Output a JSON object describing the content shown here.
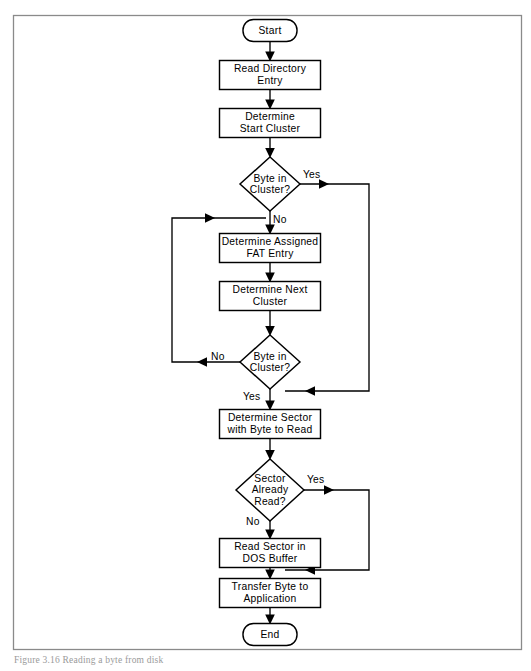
{
  "figure": {
    "caption": "Figure 3.16  Reading a byte from disk",
    "frame": {
      "x": 13,
      "y": 15,
      "width": 509,
      "height": 635,
      "border_color": "#8a8a8a"
    }
  },
  "colors": {
    "shape_stroke": "#000000",
    "shape_fill": "#ffffff",
    "connector": "#000000",
    "frame": "#8a8a8a",
    "caption_text": "#9a9a9a"
  },
  "nodes": [
    {
      "id": "start",
      "type": "terminator",
      "label": "Start",
      "lines": [
        "Start"
      ],
      "x": 243,
      "y": 19,
      "width": 54,
      "height": 23
    },
    {
      "id": "read-directory-entry",
      "type": "process",
      "label": "Read Directory Entry",
      "lines": [
        "Read  Directory",
        "Entry"
      ],
      "x": 219,
      "y": 60,
      "width": 101,
      "height": 30
    },
    {
      "id": "determine-start-cluster",
      "type": "process",
      "label": "Determine Start Cluster",
      "lines": [
        "Determine",
        "Start  Cluster"
      ],
      "x": 219,
      "y": 108,
      "width": 101,
      "height": 30
    },
    {
      "id": "byte-in-cluster-1",
      "type": "decision",
      "label": "Byte in Cluster?",
      "lines": [
        "Byte  in",
        "Cluster?"
      ],
      "x": 240,
      "y": 157,
      "width": 60,
      "height": 54
    },
    {
      "id": "determine-assigned-fat-entry",
      "type": "process",
      "label": "Determine Assigned FAT Entry",
      "lines": [
        "Determine  Assigned",
        "FAT  Entry"
      ],
      "x": 219,
      "y": 233,
      "width": 101,
      "height": 30
    },
    {
      "id": "determine-next-cluster",
      "type": "process",
      "label": "Determine Next Cluster",
      "lines": [
        "Determine  Next",
        "Cluster"
      ],
      "x": 219,
      "y": 281,
      "width": 101,
      "height": 30
    },
    {
      "id": "byte-in-cluster-2",
      "type": "decision",
      "label": "Byte in Cluster?",
      "lines": [
        "Byte  in",
        "Cluster?"
      ],
      "x": 240,
      "y": 335,
      "width": 60,
      "height": 54
    },
    {
      "id": "determine-sector-with-byte",
      "type": "process",
      "label": "Determine Sector with Byte to Read",
      "lines": [
        "Determine  Sector",
        "with  Byte  to  Read"
      ],
      "x": 219,
      "y": 409,
      "width": 101,
      "height": 30
    },
    {
      "id": "sector-already-read",
      "type": "decision",
      "label": "Sector Already Read?",
      "lines": [
        "Sector",
        "Already",
        "Read?"
      ],
      "x": 236,
      "y": 459,
      "width": 68,
      "height": 62
    },
    {
      "id": "read-sector-in-dos-buffer",
      "type": "process",
      "label": "Read Sector in DOS Buffer",
      "lines": [
        "Read  Sector  in",
        "DOS  Buffer"
      ],
      "x": 219,
      "y": 538,
      "width": 101,
      "height": 30
    },
    {
      "id": "transfer-byte-to-application",
      "type": "process",
      "label": "Transfer Byte to Application",
      "lines": [
        "Transfer  Byte  to",
        "Application"
      ],
      "x": 219,
      "y": 578,
      "width": 101,
      "height": 30
    },
    {
      "id": "end",
      "type": "terminator",
      "label": "End",
      "lines": [
        "End"
      ],
      "x": 243,
      "y": 623,
      "width": 54,
      "height": 23
    }
  ],
  "edge_labels": [
    {
      "id": "yes-1",
      "text": "Yes",
      "x": 303,
      "y": 175
    },
    {
      "id": "no-1",
      "text": "No",
      "x": 272,
      "y": 220
    },
    {
      "id": "no-2",
      "text": "No",
      "x": 213,
      "y": 357
    },
    {
      "id": "yes-2",
      "text": "Yes",
      "x": 246,
      "y": 397
    },
    {
      "id": "yes-3",
      "text": "Yes",
      "x": 306,
      "y": 479
    },
    {
      "id": "no-3",
      "text": "No",
      "x": 248,
      "y": 522
    }
  ],
  "edges": [
    {
      "id": "start-to-read-directory-entry",
      "from": "start",
      "to": "read-directory-entry"
    },
    {
      "id": "read-directory-entry-to-determine-start-cluster",
      "from": "read-directory-entry",
      "to": "determine-start-cluster"
    },
    {
      "id": "determine-start-cluster-to-byte-in-cluster-1",
      "from": "determine-start-cluster",
      "to": "byte-in-cluster-1"
    },
    {
      "id": "byte-in-cluster-1-yes",
      "from": "byte-in-cluster-1",
      "to": "byte-in-cluster-2-join",
      "label": "Yes"
    },
    {
      "id": "byte-in-cluster-1-no",
      "from": "byte-in-cluster-1",
      "to": "determine-assigned-fat-entry",
      "label": "No"
    },
    {
      "id": "determine-assigned-fat-entry-to-determine-next-cluster",
      "from": "determine-assigned-fat-entry",
      "to": "determine-next-cluster"
    },
    {
      "id": "determine-next-cluster-to-byte-in-cluster-2",
      "from": "determine-next-cluster",
      "to": "byte-in-cluster-2"
    },
    {
      "id": "byte-in-cluster-2-no",
      "from": "byte-in-cluster-2",
      "to": "determine-assigned-fat-entry",
      "label": "No"
    },
    {
      "id": "byte-in-cluster-2-yes",
      "from": "byte-in-cluster-2",
      "to": "determine-sector-with-byte",
      "label": "Yes"
    },
    {
      "id": "determine-sector-with-byte-to-sector-already-read",
      "from": "determine-sector-with-byte",
      "to": "sector-already-read"
    },
    {
      "id": "sector-already-read-yes",
      "from": "sector-already-read",
      "to": "transfer-byte-to-application",
      "label": "Yes"
    },
    {
      "id": "sector-already-read-no",
      "from": "sector-already-read",
      "to": "read-sector-in-dos-buffer",
      "label": "No"
    },
    {
      "id": "read-sector-in-dos-buffer-to-transfer-byte",
      "from": "read-sector-in-dos-buffer",
      "to": "transfer-byte-to-application"
    },
    {
      "id": "transfer-byte-to-end",
      "from": "transfer-byte-to-application",
      "to": "end"
    }
  ]
}
